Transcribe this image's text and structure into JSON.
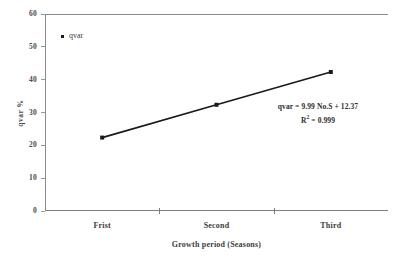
{
  "chart_data": {
    "type": "line",
    "title": "",
    "subtitle": "",
    "xlabel": "Growth period (Seasons)",
    "ylabel": "qvar  %",
    "categories": [
      "Frist",
      "Second",
      "Third"
    ],
    "x": [
      1,
      2,
      3
    ],
    "series": [
      {
        "name": "qvar",
        "values": [
          22.36,
          32.35,
          42.34
        ]
      }
    ],
    "ylim": [
      0,
      60
    ],
    "yticks": [
      0,
      10,
      20,
      30,
      40,
      50,
      60
    ],
    "ytick_labels": [
      "0",
      "10",
      "20",
      "30",
      "40",
      "50",
      "60"
    ],
    "grid": false,
    "legend": {
      "position": "top-left-inside",
      "entries": [
        "qvar"
      ]
    },
    "annotations": {
      "equation": "qvar = 9.99 No.S + 12.37",
      "r_squared_prefix": "R",
      "r_squared_exponent": "2",
      "r_squared_value": " = 0.999"
    },
    "colors": {
      "line": "#1a1a1a",
      "marker": "#1a1a1a",
      "axis": "#8a8a8a",
      "text": "#3d3d3d",
      "background": "#ffffff"
    }
  }
}
